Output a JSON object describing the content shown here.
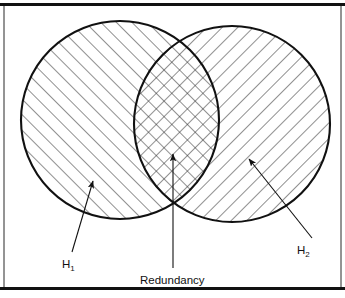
{
  "figure": {
    "type": "venn-diagram",
    "title": "",
    "caption": "",
    "background_color": "#ffffff",
    "stroke_color": "#111111",
    "hatch_color": "#333333",
    "frame": {
      "top_rule": true,
      "bottom_rule": true,
      "left_rule": true,
      "right_rule": true,
      "rule_color": "#111111"
    },
    "sets": [
      {
        "id": "H1",
        "label": "H",
        "subscript": "1",
        "hatch_direction": "forward-slash",
        "center_x": 120,
        "center_y": 120,
        "radius": 99
      },
      {
        "id": "H2",
        "label": "H",
        "subscript": "2",
        "hatch_direction": "back-slash",
        "center_x": 232,
        "center_y": 124,
        "radius": 98
      }
    ],
    "intersection": {
      "id": "redundancy",
      "label": "Redundancy",
      "hatch_direction": "cross-hatch"
    },
    "callouts": [
      {
        "id": "callout-h1",
        "label": "H",
        "subscript": "1",
        "label_x": 79,
        "label_y": 265,
        "line_from_x": 72,
        "line_from_y": 252,
        "line_to_x": 93,
        "line_to_y": 180,
        "arrow": "up-right"
      },
      {
        "id": "callout-redundancy",
        "label": "Redundancy",
        "label_x": 175,
        "label_y": 281,
        "line_from_x": 173,
        "line_from_y": 268,
        "line_to_x": 173,
        "line_to_y": 153,
        "arrow": "up"
      },
      {
        "id": "callout-h2",
        "label": "H",
        "subscript": "2",
        "label_x": 303,
        "label_y": 251,
        "line_from_x": 312,
        "line_from_y": 238,
        "line_to_x": 248,
        "line_to_y": 158,
        "arrow": "up-left"
      }
    ]
  }
}
